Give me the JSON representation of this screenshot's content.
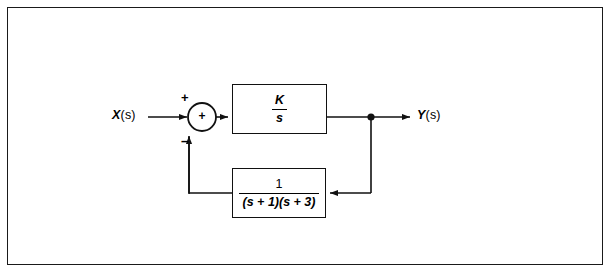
{
  "figure": {
    "type": "control-system-block-diagram",
    "background_color": "#ffffff",
    "line_color": "#111111",
    "border": {
      "present": true,
      "color": "#1a1a1a"
    }
  },
  "signals": {
    "input": {
      "var": "X",
      "arg": "(s)",
      "full": "X(s)"
    },
    "output": {
      "var": "Y",
      "arg": "(s)",
      "full": "Y(s)"
    }
  },
  "summing_junction": {
    "name": "summing-junction",
    "interior_symbol": "+",
    "input_sign": "+",
    "feedback_sign": "–"
  },
  "blocks": {
    "forward": {
      "name": "forward-path-block",
      "numerator": "K",
      "denominator": "s",
      "expression": "K/s"
    },
    "feedback": {
      "name": "feedback-path-block",
      "numerator": "1",
      "denominator": "(s + 1)(s + 3)",
      "expression": "1/((s + 1)(s + 3))"
    }
  },
  "nodes": {
    "takeoff": {
      "name": "takeoff-node",
      "style": "filled-dot"
    }
  }
}
